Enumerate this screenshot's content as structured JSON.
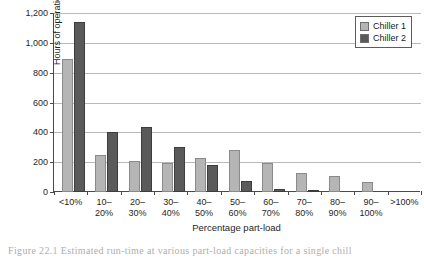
{
  "figure": {
    "caption": "Figure 22.1 Estimated run-time at various part-load capacities for a single chill"
  },
  "legend": {
    "position": "top-right",
    "entries": [
      {
        "label": "Chiller 1",
        "color": "#b5b5b5"
      },
      {
        "label": "Chiller 2",
        "color": "#5a5a5a"
      }
    ]
  },
  "axes": {
    "y_title": "Hours of operation",
    "x_title": "Percentage part-load",
    "y_ticks": [
      "0",
      "200",
      "400",
      "600",
      "800",
      "1,000",
      "1,200"
    ]
  },
  "chart_data": {
    "type": "bar",
    "title": "",
    "subtitle": "",
    "xlabel": "Percentage part-load",
    "ylabel": "Hours of operation",
    "ylim": [
      0,
      1200
    ],
    "ytick_values": [
      0,
      200,
      400,
      600,
      800,
      1000,
      1200
    ],
    "grid": true,
    "legend_position": "top-right",
    "categories": [
      "<10%",
      "10-20%",
      "20-30%",
      "30-40%",
      "40-50%",
      "50-60%",
      "60-70%",
      "70-80%",
      "80-90%",
      "90-100%",
      ">100%"
    ],
    "category_lines": [
      [
        "<10%"
      ],
      [
        "10–",
        "20%"
      ],
      [
        "20–",
        "30%"
      ],
      [
        "30–",
        "40%"
      ],
      [
        "40–",
        "50%"
      ],
      [
        "50–",
        "60%"
      ],
      [
        "60–",
        "70%"
      ],
      [
        "70–",
        "80%"
      ],
      [
        "80–",
        "90%"
      ],
      [
        "90–",
        "100%"
      ],
      [
        ">100%"
      ]
    ],
    "series": [
      {
        "name": "Chiller 1",
        "color": "#b5b5b5",
        "values": [
          890,
          245,
          205,
          195,
          225,
          285,
          195,
          130,
          105,
          65,
          0
        ]
      },
      {
        "name": "Chiller 2",
        "color": "#5a5a5a",
        "values": [
          1140,
          400,
          435,
          300,
          180,
          75,
          18,
          3,
          0,
          0,
          0
        ]
      }
    ]
  }
}
